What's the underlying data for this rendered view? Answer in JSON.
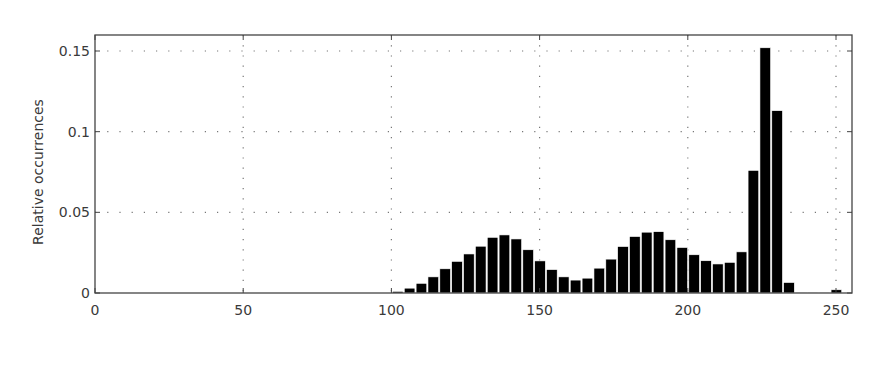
{
  "chart_data": {
    "type": "bar",
    "title": "",
    "xlabel": "",
    "ylabel": "Relative occurrences",
    "xlim": [
      0,
      256
    ],
    "ylim": [
      0,
      0.16
    ],
    "bin_width": 4,
    "grid": true,
    "grid_style": "dotted",
    "legend": null,
    "x_ticks": [
      0,
      50,
      100,
      150,
      200,
      250
    ],
    "x_tick_labels": [
      "0",
      "50",
      "100",
      "150",
      "200",
      "250"
    ],
    "y_ticks": [
      0,
      0.05,
      0.1,
      0.15
    ],
    "y_tick_labels": [
      "0",
      "0.05",
      "0.1",
      "0.15"
    ],
    "bar_color": "#000000",
    "bins": [
      100,
      104,
      108,
      112,
      116,
      120,
      124,
      128,
      132,
      136,
      140,
      144,
      148,
      152,
      156,
      160,
      164,
      168,
      172,
      176,
      180,
      184,
      188,
      192,
      196,
      200,
      204,
      208,
      212,
      216,
      220,
      224,
      228,
      232,
      236,
      240,
      244,
      248
    ],
    "values": [
      0.001,
      0.003,
      0.006,
      0.01,
      0.015,
      0.0196,
      0.0242,
      0.029,
      0.0345,
      0.036,
      0.0335,
      0.0268,
      0.0199,
      0.0145,
      0.01,
      0.008,
      0.0092,
      0.0154,
      0.021,
      0.0288,
      0.035,
      0.0377,
      0.038,
      0.033,
      0.0282,
      0.0237,
      0.02,
      0.018,
      0.019,
      0.0255,
      0.076,
      0.152,
      0.113,
      0.0065,
      0.0003,
      0.0003,
      0.0003,
      0.002
    ]
  }
}
